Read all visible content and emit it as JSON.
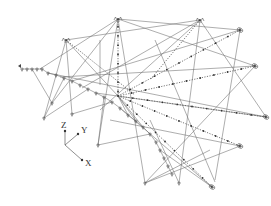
{
  "figure": {
    "line_color": "#6a6a6a",
    "node_color": "#333333"
  },
  "axes": {
    "x_label": "X",
    "y_label": "Y",
    "z_label": "Z"
  },
  "structure": {
    "hub": "central-hub",
    "apex_nodes": [
      "apex-left",
      "apex-center",
      "apex-right"
    ],
    "support_count_base_arc": 24,
    "support_count_outer": 5
  }
}
